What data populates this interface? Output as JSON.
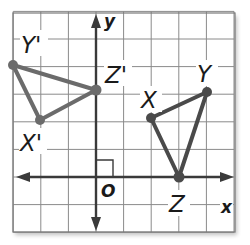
{
  "diagram": {
    "grid": {
      "x_min": -3,
      "x_max": 5,
      "y_min": -2,
      "y_max": 6,
      "origin_px": [
        96,
        177
      ],
      "unit_px": 27.6,
      "line_color": "#8a8a8a",
      "border_color": "#7a7a7a"
    },
    "axes": {
      "x_label": "x",
      "y_label": "y",
      "origin_label": "O",
      "color": "#3a3a3a"
    },
    "triangles": [
      {
        "name": "XYZ",
        "color": "#4a4a4a",
        "vertices": [
          {
            "label": "X",
            "x": 2,
            "y": 2
          },
          {
            "label": "Y",
            "x": 4,
            "y": 3
          },
          {
            "label": "Z",
            "x": 3,
            "y": 0
          }
        ]
      },
      {
        "name": "X'Y'Z'",
        "color": "#6b6b6b",
        "vertices": [
          {
            "label": "X'",
            "x": -2,
            "y": 2
          },
          {
            "label": "Y'",
            "x": -3,
            "y": 4
          },
          {
            "label": "Z'",
            "x": 0,
            "y": 3
          }
        ]
      }
    ],
    "labels": {
      "x_axis": "x",
      "y_axis": "y",
      "origin": "O",
      "X": "X",
      "Y": "Y",
      "Z": "Z",
      "X_prime": "X'",
      "Y_prime": "Y'",
      "Z_prime": "Z'"
    }
  }
}
